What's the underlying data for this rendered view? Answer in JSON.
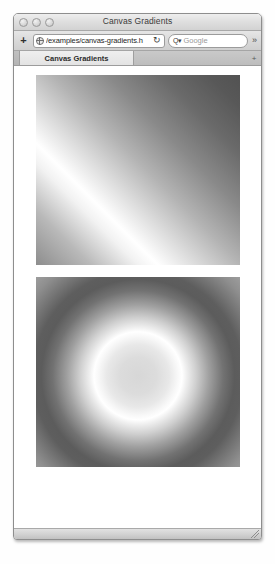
{
  "window": {
    "title": "Canvas Gradients",
    "traffic_lights": [
      "close",
      "minimize",
      "zoom"
    ]
  },
  "toolbar": {
    "add_label": "+",
    "url_value": "/examples/canvas-gradients.h",
    "url_placeholder": "Enter address",
    "globe_icon": "globe-icon",
    "reload_glyph": "↻",
    "search_glyph": "Q▾",
    "search_value": "",
    "search_placeholder": "Google",
    "overflow_glyph": "»"
  },
  "tabbar": {
    "tabs": [
      {
        "label": "Canvas Gradients",
        "active": true
      },
      {
        "label": "",
        "active": false
      }
    ],
    "new_tab_label": "+"
  },
  "content": {
    "canvases": [
      {
        "name": "linear-gradient-canvas",
        "type": "linear",
        "description": "Diagonal linear gradient with bright band running lower-left to upper-right"
      },
      {
        "name": "radial-gradient-canvas",
        "type": "radial",
        "description": "Radial gradient with light center, bright ring, dark outer halo"
      }
    ]
  },
  "statusbar": {
    "text": "",
    "resize_grip": "resize-grip-icon"
  }
}
